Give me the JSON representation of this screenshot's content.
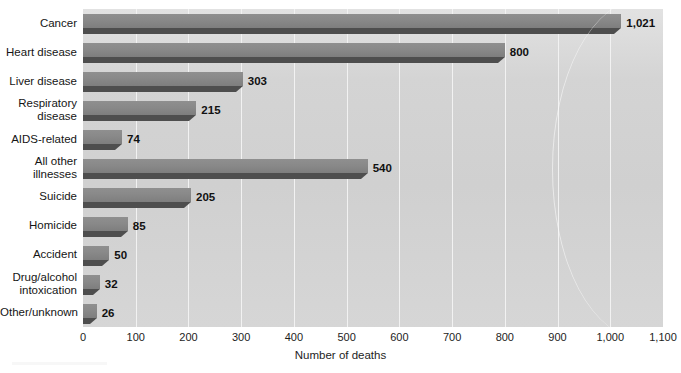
{
  "chart_data": {
    "type": "bar",
    "orientation": "horizontal",
    "title": "",
    "xlabel": "Number of deaths",
    "ylabel": "",
    "xlim": [
      0,
      1100
    ],
    "xticks": [
      "0",
      "100",
      "200",
      "300",
      "400",
      "500",
      "600",
      "700",
      "800",
      "900",
      "1,000",
      "1,100"
    ],
    "xtick_values": [
      0,
      100,
      200,
      300,
      400,
      500,
      600,
      700,
      800,
      900,
      1000,
      1100
    ],
    "grid": "vertical",
    "legend": "none",
    "categories": [
      "Cancer",
      "Heart disease",
      "Liver disease",
      "Respiratory\ndisease",
      "AIDS-related",
      "All other\nillnesses",
      "Suicide",
      "Homicide",
      "Accident",
      "Drug/alcohol\nintoxication",
      "Other/unknown"
    ],
    "values": [
      1021,
      800,
      303,
      215,
      74,
      540,
      205,
      85,
      50,
      32,
      26
    ],
    "value_labels": [
      "1,021",
      "800",
      "303",
      "215",
      "74",
      "540",
      "205",
      "85",
      "50",
      "32",
      "26"
    ],
    "colors": {
      "bar_top": "#8b8b8b",
      "bar_face": "#4e4e4e",
      "plot_background": "#d4d4d4",
      "gridline": "#f2f2f2",
      "text": "#151515",
      "figure_background": "#ffffff"
    }
  }
}
